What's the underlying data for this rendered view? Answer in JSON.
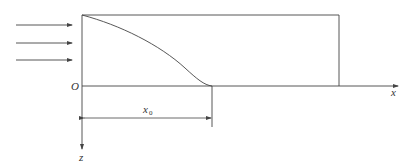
{
  "diagram": {
    "labels": {
      "origin": "O",
      "x_axis": "x",
      "z_axis": "z",
      "dimension": "x",
      "dimension_sub": "0"
    },
    "colors": {
      "line": "#444444",
      "text": "#333333",
      "background": "#ffffff"
    },
    "incoming_arrows": 3
  }
}
